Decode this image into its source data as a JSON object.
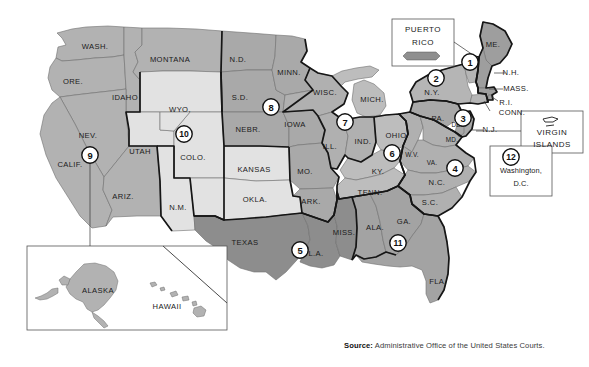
{
  "source": {
    "prefix": "Source:",
    "text": " Administrative Office of the United States Courts."
  },
  "colors": {
    "circuit_1": "#9e9e9e",
    "circuit_2": "#b5b5b5",
    "circuit_3": "#a8a8a8",
    "circuit_4": "#b0b0b0",
    "circuit_5": "#8d8d8d",
    "circuit_6": "#bdbdbd",
    "circuit_7": "#b0b0b0",
    "circuit_8": "#a9a9a9",
    "circuit_9": "#b2b2b2",
    "circuit_10": "#e2e2e2",
    "circuit_11": "#a3a3a3",
    "outline": "#1a1a1a",
    "state_line": "#6a6a6a",
    "background": "#ffffff"
  },
  "circuits": [
    {
      "number": "1",
      "cx": 470,
      "cy": 62,
      "states": "ME, NH, MA, RI, PR"
    },
    {
      "number": "2",
      "cx": 436,
      "cy": 78,
      "states": "NY, VT, CT"
    },
    {
      "number": "3",
      "cx": 463,
      "cy": 118,
      "states": "PA, NJ, DE, VI"
    },
    {
      "number": "4",
      "cx": 455,
      "cy": 168,
      "states": "MD, VA, WV, NC, SC"
    },
    {
      "number": "5",
      "cx": 300,
      "cy": 250,
      "states": "TX, LA, MS"
    },
    {
      "number": "6",
      "cx": 392,
      "cy": 153,
      "states": "OH, KY, TN, MI"
    },
    {
      "number": "7",
      "cx": 345,
      "cy": 122,
      "states": "IL, IN, WI"
    },
    {
      "number": "8",
      "cx": 271,
      "cy": 107,
      "states": "ND, SD, MN, IA, NE, MO, AR"
    },
    {
      "number": "9",
      "cx": 90,
      "cy": 155,
      "states": "CA, OR, WA, NV, ID, MT, AZ, AK, HI"
    },
    {
      "number": "10",
      "cx": 184,
      "cy": 134,
      "states": "WY, UT, CO, NM, KS, OK"
    },
    {
      "number": "11",
      "cx": 398,
      "cy": 243,
      "states": "AL, GA, FL"
    },
    {
      "number": "12",
      "cx": 511,
      "cy": 157,
      "states": "District of Columbia"
    }
  ],
  "state_labels": [
    {
      "id": "wash",
      "text": "WASH.",
      "x": 95,
      "y": 47,
      "size": "n"
    },
    {
      "id": "ore",
      "text": "ORE.",
      "x": 73,
      "y": 82,
      "size": "n"
    },
    {
      "id": "idaho",
      "text": "IDAHO",
      "x": 125,
      "y": 98,
      "size": "n"
    },
    {
      "id": "montana",
      "text": "MONTANA",
      "x": 170,
      "y": 60,
      "size": "n"
    },
    {
      "id": "nd",
      "text": "N.D.",
      "x": 238,
      "y": 60,
      "size": "n"
    },
    {
      "id": "sd",
      "text": "S.D.",
      "x": 240,
      "y": 98,
      "size": "n"
    },
    {
      "id": "minn",
      "text": "MINN.",
      "x": 289,
      "y": 73,
      "size": "n"
    },
    {
      "id": "wisc",
      "text": "WISC.",
      "x": 325,
      "y": 93,
      "size": "n"
    },
    {
      "id": "mich",
      "text": "MICH.",
      "x": 372,
      "y": 100,
      "size": "n"
    },
    {
      "id": "nev",
      "text": "NEV.",
      "x": 88,
      "y": 136,
      "size": "n"
    },
    {
      "id": "calif",
      "text": "CALIF.",
      "x": 70,
      "y": 165,
      "size": "n"
    },
    {
      "id": "wyo",
      "text": "WYO.",
      "x": 180,
      "y": 110,
      "size": "n"
    },
    {
      "id": "utah",
      "text": "UTAH",
      "x": 140,
      "y": 152,
      "size": "n"
    },
    {
      "id": "colo",
      "text": "COLO.",
      "x": 193,
      "y": 158,
      "size": "n"
    },
    {
      "id": "nebr",
      "text": "NEBR.",
      "x": 248,
      "y": 130,
      "size": "n"
    },
    {
      "id": "iowa",
      "text": "IOWA",
      "x": 295,
      "y": 125,
      "size": "n"
    },
    {
      "id": "ill",
      "text": "ILL.",
      "x": 330,
      "y": 147,
      "size": "n"
    },
    {
      "id": "ind",
      "text": "IND.",
      "x": 363,
      "y": 142,
      "size": "n"
    },
    {
      "id": "ohio",
      "text": "OHIO",
      "x": 396,
      "y": 136,
      "size": "n"
    },
    {
      "id": "kansas",
      "text": "KANSAS",
      "x": 254,
      "y": 170,
      "size": "n"
    },
    {
      "id": "mo",
      "text": "MO.",
      "x": 305,
      "y": 172,
      "size": "n"
    },
    {
      "id": "ariz",
      "text": "ARIZ.",
      "x": 123,
      "y": 197,
      "size": "n"
    },
    {
      "id": "nm",
      "text": "N.M.",
      "x": 178,
      "y": 208,
      "size": "n"
    },
    {
      "id": "okla",
      "text": "OKLA.",
      "x": 255,
      "y": 200,
      "size": "n"
    },
    {
      "id": "ark",
      "text": "ARK.",
      "x": 311,
      "y": 202,
      "size": "n"
    },
    {
      "id": "texas",
      "text": "TEXAS",
      "x": 245,
      "y": 243,
      "size": "n"
    },
    {
      "id": "la",
      "text": "L.A.",
      "x": 316,
      "y": 254,
      "size": "n"
    },
    {
      "id": "miss",
      "text": "MISS.",
      "x": 344,
      "y": 233,
      "size": "n"
    },
    {
      "id": "ala",
      "text": "ALA.",
      "x": 375,
      "y": 228,
      "size": "n"
    },
    {
      "id": "ga",
      "text": "GA.",
      "x": 404,
      "y": 222,
      "size": "n"
    },
    {
      "id": "tenn",
      "text": "TENN.",
      "x": 370,
      "y": 193,
      "size": "n"
    },
    {
      "id": "ky",
      "text": "KY.",
      "x": 378,
      "y": 172,
      "size": "n"
    },
    {
      "id": "wv",
      "text": "W.V.",
      "x": 412,
      "y": 155,
      "size": "sm"
    },
    {
      "id": "va",
      "text": "VA.",
      "x": 432,
      "y": 163,
      "size": "sm"
    },
    {
      "id": "nc",
      "text": "N.C.",
      "x": 437,
      "y": 183,
      "size": "n"
    },
    {
      "id": "sc",
      "text": "S.C.",
      "x": 430,
      "y": 203,
      "size": "n"
    },
    {
      "id": "fla",
      "text": "FLA.",
      "x": 438,
      "y": 282,
      "size": "n"
    },
    {
      "id": "pa",
      "text": "PA.",
      "x": 438,
      "y": 119,
      "size": "n"
    },
    {
      "id": "ny",
      "text": "N.Y.",
      "x": 432,
      "y": 93,
      "size": "n"
    },
    {
      "id": "me",
      "text": "ME.",
      "x": 493,
      "y": 45,
      "size": "n"
    },
    {
      "id": "vt",
      "text": "VT.",
      "x": 468,
      "y": 62,
      "size": "xs"
    },
    {
      "id": "del",
      "text": "DEL.",
      "x": 459,
      "y": 125,
      "size": "sm"
    },
    {
      "id": "md",
      "text": "MD.",
      "x": 452,
      "y": 140,
      "size": "sm"
    },
    {
      "id": "alaska",
      "text": "ALASKA",
      "x": 98,
      "y": 291,
      "size": "n"
    },
    {
      "id": "hawaii",
      "text": "HAWAII",
      "x": 167,
      "y": 307,
      "size": "n"
    }
  ],
  "leader_labels": [
    {
      "id": "nh",
      "text": "N.H.",
      "x": 511,
      "y": 73,
      "lx1": 494,
      "ly1": 73,
      "lx2": 505,
      "ly2": 73
    },
    {
      "id": "mass",
      "text": "MASS.",
      "x": 516,
      "y": 89,
      "lx1": 489,
      "ly1": 89,
      "lx2": 503,
      "ly2": 89
    },
    {
      "id": "ri",
      "text": "R.I.",
      "x": 506,
      "y": 103,
      "lx1": 492,
      "ly1": 97,
      "lx2": 498,
      "ly2": 101
    },
    {
      "id": "conn",
      "text": "CONN.",
      "x": 512,
      "y": 113,
      "lx1": 484,
      "ly1": 101,
      "lx2": 490,
      "ly2": 111
    },
    {
      "id": "nj",
      "text": "N.J.",
      "x": 490,
      "y": 130,
      "lx1": 472,
      "ly1": 130,
      "lx2": 483,
      "ly2": 130
    }
  ],
  "boxes": {
    "puerto_rico": {
      "label_line1": "PUERTO",
      "label_line2": "RICO",
      "x": 392,
      "y": 19,
      "w": 62,
      "h": 47
    },
    "virgin_islands": {
      "label_line1": "VIRGIN",
      "label_line2": "ISLANDS",
      "x": 521,
      "y": 111,
      "w": 62,
      "h": 42
    },
    "dc": {
      "label_line1": "Washington,",
      "label_line2": "D.C.",
      "number": "12",
      "x": 490,
      "y": 146,
      "w": 62,
      "h": 50
    },
    "inset": {
      "x": 27,
      "y": 246,
      "w": 200,
      "h": 84
    }
  }
}
